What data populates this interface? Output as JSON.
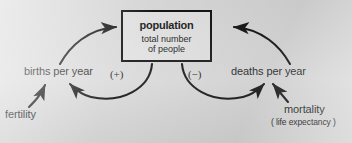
{
  "diagram": {
    "type": "causal-loop-diagram",
    "background_color": "#d9d9d9",
    "ink_color": "#111111",
    "central_node": {
      "title": "population",
      "subtitle_line1": "total number",
      "subtitle_line2": "of people"
    },
    "nodes": [
      {
        "id": "births",
        "label": "births per year"
      },
      {
        "id": "deaths",
        "label": "deaths per year"
      },
      {
        "id": "fertility",
        "label": "fertility"
      },
      {
        "id": "mortality",
        "label": "mortality"
      },
      {
        "id": "life_expectancy",
        "label": "( life expectancy )"
      }
    ],
    "polarity_signs": [
      {
        "id": "plus",
        "label": "(+)",
        "loop": "reinforcing",
        "side": "left"
      },
      {
        "id": "minus",
        "label": "(−)",
        "loop": "balancing",
        "side": "right"
      }
    ],
    "links": [
      {
        "id": "births-to-population",
        "from": "births per year",
        "to": "population",
        "style": "curved-arrow"
      },
      {
        "id": "population-to-births",
        "from": "population",
        "to": "births per year",
        "style": "curved-arrow",
        "sign": "(+)"
      },
      {
        "id": "deaths-to-population",
        "from": "deaths per year",
        "to": "population",
        "style": "curved-arrow"
      },
      {
        "id": "population-to-deaths",
        "from": "population",
        "to": "deaths per year",
        "style": "curved-arrow",
        "sign": "(−)"
      },
      {
        "id": "fertility-to-births",
        "from": "fertility",
        "to": "births per year",
        "style": "curved-arrow"
      },
      {
        "id": "mortality-to-deaths",
        "from": "mortality",
        "to": "deaths per year",
        "style": "curved-arrow"
      }
    ]
  }
}
